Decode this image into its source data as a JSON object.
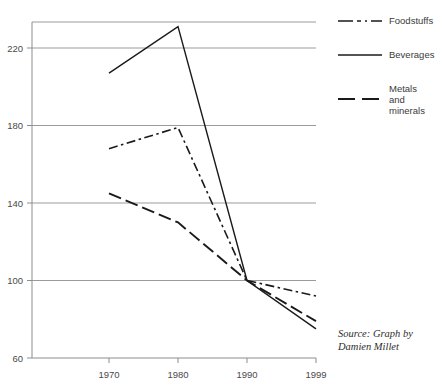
{
  "chart_data": {
    "type": "line",
    "title": "",
    "xlabel": "",
    "ylabel": "",
    "x": [
      "1970",
      "1980",
      "1990",
      "1999"
    ],
    "categories": [
      "1970",
      "1980",
      "1990",
      "1999"
    ],
    "ylim": [
      60,
      240
    ],
    "ytick_labels": [
      "220",
      "180",
      "140",
      "100",
      "60"
    ],
    "ytick_values": [
      220,
      180,
      140,
      100,
      60
    ],
    "grid": true,
    "legend_position": "right",
    "series": [
      {
        "name": "Foodstuffs",
        "style": "dash-dot",
        "color": "#1a1a1a",
        "values": [
          168,
          179,
          100,
          92
        ]
      },
      {
        "name": "Beverages",
        "style": "solid",
        "color": "#1a1a1a",
        "values": [
          207,
          231,
          100,
          75
        ]
      },
      {
        "name": "Metals\nand\nminerals",
        "style": "long-dash",
        "color": "#1a1a1a",
        "values": [
          145,
          130,
          100,
          79
        ]
      }
    ],
    "annotations": [
      {
        "text": "Source: Graph by\nDamien Millet",
        "position": "bottom-right"
      }
    ]
  },
  "legend": {
    "items": [
      {
        "label": "Foodstuffs",
        "swatch": "dash-dot-line-icon"
      },
      {
        "label": "Beverages",
        "swatch": "solid-line-icon"
      },
      {
        "label": "Metals\nand\nminerals",
        "swatch": "long-dash-line-icon"
      }
    ]
  },
  "source_note": "Source: Graph by\nDamien Millet",
  "colors": {
    "line": "#1a1a1a",
    "grid": "#9b9b9b",
    "axis": "#8d8d8d",
    "text": "#3a3a3a",
    "background": "#ffffff"
  }
}
